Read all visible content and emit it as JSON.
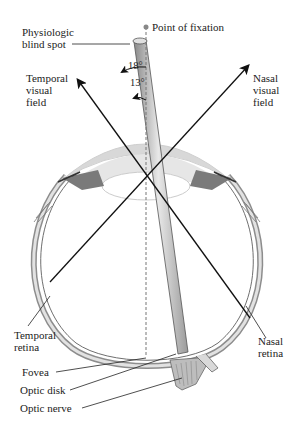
{
  "figure": {
    "colors": {
      "line": "#111111",
      "sclera_gray": "#b8b8b8",
      "light_gray": "#e4e4e4",
      "mid_gray": "#9a9a9a",
      "dark_gray": "#555555",
      "fixation_dot": "#888888",
      "background": "#ffffff"
    }
  },
  "labels": {
    "blind_spot": "Physiologic\nblind spot",
    "fixation": "Point of fixation",
    "temporal_field": "Temporal\nvisual\nfield",
    "nasal_field": "Nasal\nvisual\nfield",
    "temporal_retina": "Temporal\nretina",
    "nasal_retina": "Nasal\nretina",
    "fovea": "Fovea",
    "optic_disk": "Optic disk",
    "optic_nerve": "Optic nerve"
  },
  "angles": {
    "outer": "18°",
    "inner": "13°"
  }
}
